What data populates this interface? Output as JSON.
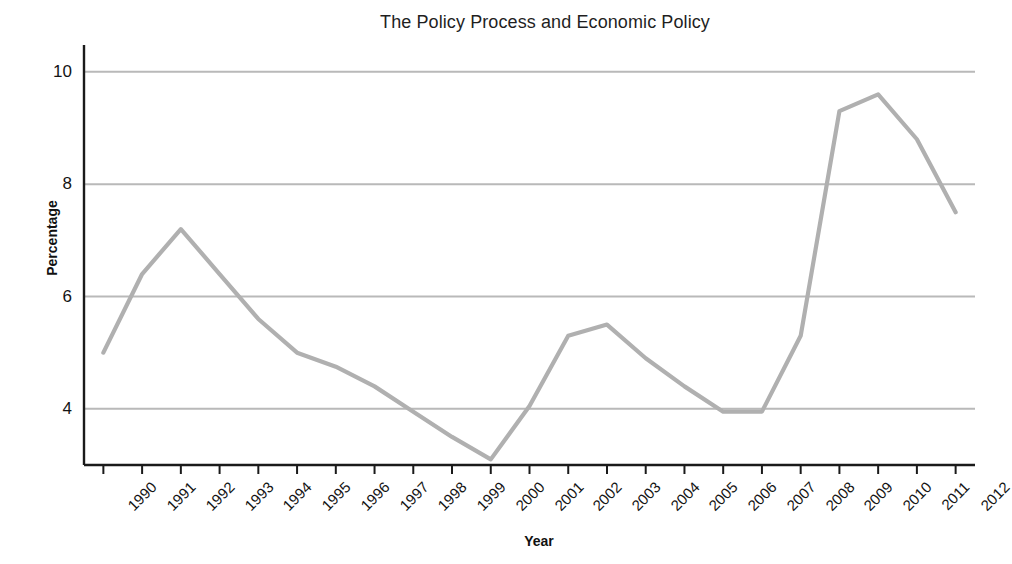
{
  "chart_data": {
    "type": "line",
    "title": "The Policy Process and Economic Policy",
    "xlabel": "Year",
    "ylabel": "Percentage",
    "grid": true,
    "legend": "none",
    "xlim": [
      1990,
      2012
    ],
    "ylim": [
      3.0,
      10.3
    ],
    "ytick_labels": [
      "4",
      "6",
      "8",
      "10"
    ],
    "yticks": [
      4,
      6,
      8,
      10
    ],
    "categories": [
      "1990",
      "1991",
      "1992",
      "1993",
      "1994",
      "1995",
      "1996",
      "1997",
      "1998",
      "1999",
      "2000",
      "2001",
      "2002",
      "2003",
      "2004",
      "2005",
      "2006",
      "2007",
      "2008",
      "2009",
      "2010",
      "2011",
      "2012"
    ],
    "x": [
      1990,
      1991,
      1992,
      1993,
      1994,
      1995,
      1996,
      1997,
      1998,
      1999,
      2000,
      2001,
      2002,
      2003,
      2004,
      2005,
      2006,
      2007,
      2008,
      2009,
      2010,
      2011,
      2012
    ],
    "values": [
      5.0,
      6.4,
      7.2,
      6.4,
      5.6,
      5.0,
      4.75,
      4.4,
      3.95,
      3.5,
      3.1,
      4.05,
      5.3,
      5.5,
      4.9,
      4.4,
      3.95,
      3.95,
      5.3,
      9.3,
      9.6,
      8.8,
      7.5
    ],
    "series": [
      {
        "name": "Unemployment rate",
        "values": [
          5.0,
          6.4,
          7.2,
          6.4,
          5.6,
          5.0,
          4.75,
          4.4,
          3.95,
          3.5,
          3.1,
          4.05,
          5.3,
          5.5,
          4.9,
          4.4,
          3.95,
          3.95,
          5.3,
          9.3,
          9.6,
          8.8,
          7.5
        ],
        "color": "#b0b0b0"
      }
    ],
    "colors": {
      "line": "#b0b0b0",
      "gridline": "#b9b9b9",
      "axis": "#1a1a1a",
      "text": "#141414",
      "background": "#ffffff"
    }
  }
}
